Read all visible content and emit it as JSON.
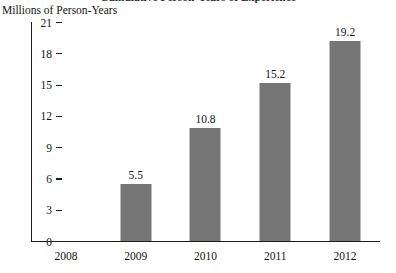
{
  "chart_data": {
    "type": "bar",
    "title": "Cumulative Person-Years of Experience",
    "ylabel": "Millions of Person-Years",
    "xlabel": "",
    "categories": [
      "2008",
      "2009",
      "2010",
      "2011",
      "2012"
    ],
    "values": [
      null,
      5.5,
      10.8,
      15.2,
      19.2
    ],
    "value_labels": [
      "",
      "5.5",
      "10.8",
      "15.2",
      "19.2"
    ],
    "series": [
      {
        "name": "Millions of Person-Years",
        "values": [
          null,
          5.5,
          10.8,
          15.2,
          19.2
        ]
      }
    ],
    "ylim": [
      0,
      21
    ],
    "yticks": [
      0,
      3,
      6,
      9,
      12,
      15,
      18,
      21
    ],
    "ytick_labels": [
      "0",
      "3",
      "6",
      "9",
      "12",
      "15",
      "18",
      "21"
    ],
    "grid": false,
    "legend": false,
    "bar_color": "#767676",
    "axis_color": "#1c1c1c",
    "background": "#ffffff"
  }
}
